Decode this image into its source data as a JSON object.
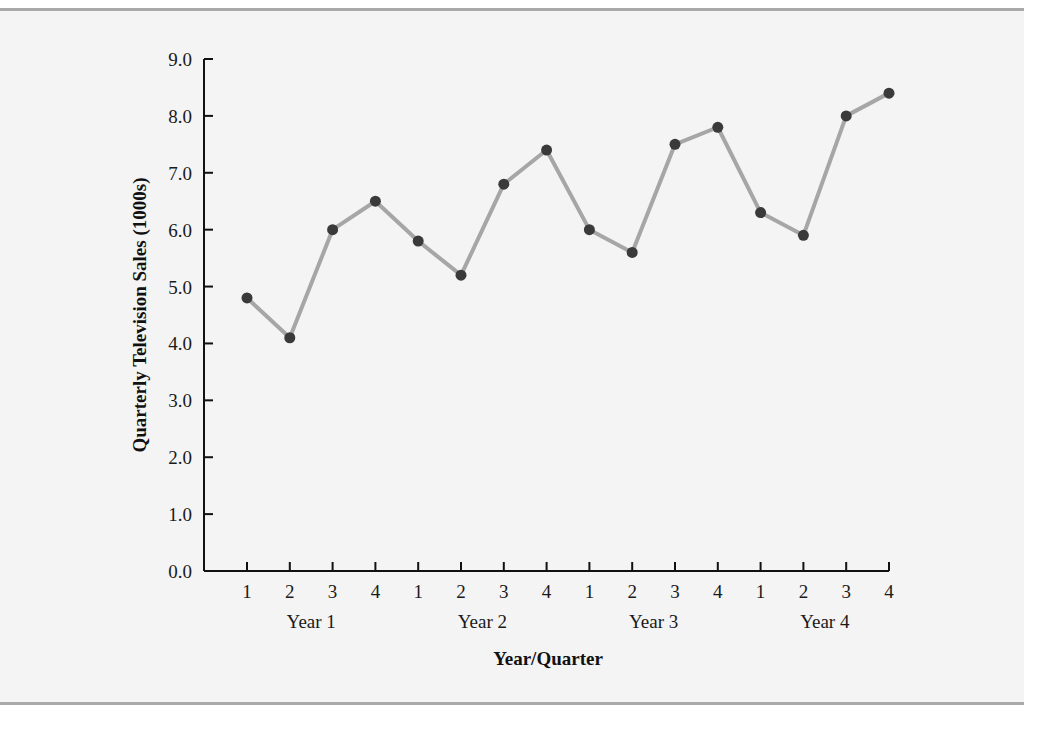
{
  "chart_data": {
    "type": "line",
    "title": "",
    "xlabel": "Year/Quarter",
    "ylabel": "Quarterly Television Sales (1000s)",
    "ylim": [
      0,
      9
    ],
    "yticks": [
      "0.0",
      "1.0",
      "2.0",
      "3.0",
      "4.0",
      "5.0",
      "6.0",
      "7.0",
      "8.0",
      "9.0"
    ],
    "grid": false,
    "legend": null,
    "categories": [
      "1",
      "2",
      "3",
      "4",
      "1",
      "2",
      "3",
      "4",
      "1",
      "2",
      "3",
      "4",
      "1",
      "2",
      "3",
      "4"
    ],
    "groups": [
      "Year 1",
      "Year 2",
      "Year 3",
      "Year 4"
    ],
    "series": [
      {
        "name": "Quarterly Television Sales",
        "values": [
          4.8,
          4.1,
          6.0,
          6.5,
          5.8,
          5.2,
          6.8,
          7.4,
          6.0,
          5.6,
          7.5,
          7.8,
          6.3,
          5.9,
          8.0,
          8.4
        ],
        "line_color": "#a6a6a6",
        "marker_color": "#3a3a3a"
      }
    ]
  }
}
